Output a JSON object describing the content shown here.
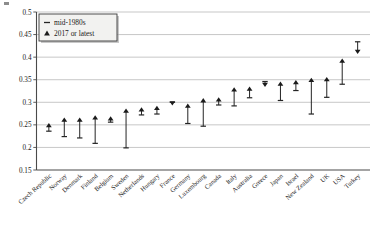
{
  "chart_data": {
    "type": "scatter",
    "title": "",
    "subtitle": "",
    "xlabel": "",
    "ylabel": "",
    "ylim": [
      0.15,
      0.5
    ],
    "ytick_values": [
      0.15,
      0.2,
      0.25,
      0.3,
      0.35,
      0.4,
      0.45,
      0.5
    ],
    "ytick_labels": [
      "0.15",
      "0.2",
      "0.25",
      "0.3",
      "0.35",
      "0.4",
      "0.45",
      "0.5"
    ],
    "grid": true,
    "legend_position": "top-left",
    "categories": [
      "Czech Republic",
      "Norway",
      "Denmark",
      "Finland",
      "Belgium",
      "Sweden",
      "Netherlands",
      "Hungary",
      "France",
      "Germany",
      "Luxembourg",
      "Canada",
      "Italy",
      "Australia",
      "Greece",
      "Japan",
      "Israel",
      "New Zealand",
      "UK",
      "USA",
      "Turkey"
    ],
    "series": [
      {
        "name": "mid-1980s",
        "marker": "dash",
        "values": [
          0.236,
          0.224,
          0.221,
          0.209,
          0.256,
          0.199,
          0.272,
          0.274,
          0.3,
          0.253,
          0.247,
          0.294,
          0.292,
          0.31,
          0.346,
          0.304,
          0.326,
          0.274,
          0.311,
          0.34,
          0.434
        ]
      },
      {
        "name": "2017 or latest",
        "marker": "triangle",
        "values": [
          0.249,
          0.261,
          0.261,
          0.266,
          0.264,
          0.281,
          0.284,
          0.287,
          0.297,
          0.292,
          0.304,
          0.306,
          0.328,
          0.33,
          0.338,
          0.341,
          0.344,
          0.349,
          0.351,
          0.392,
          0.411
        ]
      }
    ]
  },
  "legend": {
    "items": [
      {
        "label": "mid-1980s",
        "marker": "dash"
      },
      {
        "label": "2017 or latest",
        "marker": "triangle"
      }
    ]
  }
}
